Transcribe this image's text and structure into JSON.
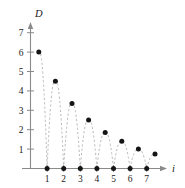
{
  "chart_data": {
    "type": "scatter",
    "title": "",
    "subtitle": "",
    "xlabel": "i",
    "ylabel": "D",
    "xlim": [
      0,
      8.2
    ],
    "ylim": [
      0,
      7.6
    ],
    "grid": false,
    "legend": "none",
    "x_ticks": [
      1,
      2,
      3,
      4,
      5,
      6,
      7
    ],
    "x_tick_labels": [
      "1",
      "2",
      "3",
      "4",
      "5",
      "6",
      "7"
    ],
    "y_ticks": [
      1,
      2,
      3,
      4,
      5,
      6,
      7
    ],
    "y_tick_labels": [
      "1",
      "2",
      "3",
      "4",
      "5",
      "6",
      "7"
    ],
    "series": [
      {
        "name": "D",
        "marker": "filled-circle",
        "marker_color": "#151515",
        "connector": "dashed-arc",
        "connector_color": "#b9b9b9",
        "points": [
          {
            "x": 0.5,
            "y": 6.0
          },
          {
            "x": 1.0,
            "y": 0.0
          },
          {
            "x": 1.5,
            "y": 4.5
          },
          {
            "x": 2.0,
            "y": 0.0
          },
          {
            "x": 2.5,
            "y": 3.35
          },
          {
            "x": 3.0,
            "y": 0.0
          },
          {
            "x": 3.5,
            "y": 2.5
          },
          {
            "x": 4.0,
            "y": 0.0
          },
          {
            "x": 4.5,
            "y": 1.85
          },
          {
            "x": 5.0,
            "y": 0.0
          },
          {
            "x": 5.5,
            "y": 1.4
          },
          {
            "x": 6.0,
            "y": 0.0
          },
          {
            "x": 6.5,
            "y": 1.0
          },
          {
            "x": 7.0,
            "y": 0.0
          },
          {
            "x": 7.5,
            "y": 0.75
          }
        ]
      }
    ],
    "annotations": []
  },
  "axes": {
    "y_axis_label": "D",
    "x_axis_label": "i"
  },
  "ticks": {
    "y": [
      {
        "label": "7"
      },
      {
        "label": "6"
      },
      {
        "label": "5"
      },
      {
        "label": "4"
      },
      {
        "label": "3"
      },
      {
        "label": "2"
      },
      {
        "label": "1"
      }
    ],
    "x": [
      {
        "label": "1"
      },
      {
        "label": "2"
      },
      {
        "label": "3"
      },
      {
        "label": "4"
      },
      {
        "label": "5"
      },
      {
        "label": "6"
      },
      {
        "label": "7"
      }
    ]
  }
}
